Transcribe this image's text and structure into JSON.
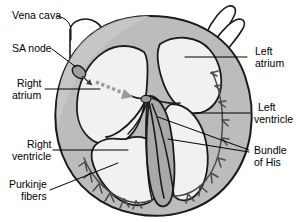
{
  "diagram": {
    "type": "anatomical-illustration",
    "labels": {
      "vena_cava": "Vena cava",
      "sa_node": "SA node",
      "right_atrium_line1": "Right",
      "right_atrium_line2": "atrium",
      "right_ventricle_line1": "Right",
      "right_ventricle_line2": "ventricle",
      "purkinje_line1": "Purkinje",
      "purkinje_line2": "fibers",
      "left_atrium_line1": "Left",
      "left_atrium_line2": "atrium",
      "left_ventricle_line1": "Left",
      "left_ventricle_line2": "ventricle",
      "bundle_of_his_line1": "Bundle",
      "bundle_of_his_line2": "of His"
    },
    "colors": {
      "outline": "#1a1a1a",
      "myocardium": "#b5b5b5",
      "myocardium_light": "#c8c8c8",
      "chamber": "#f0f0f0",
      "septum": "#a8a8a8",
      "vessel_fill": "#ffffff",
      "impulse_arrow": "#8c8c8c",
      "purkinje": "#4a4a4a",
      "leader_line": "#000000",
      "text": "#000000",
      "background": "#ffffff"
    }
  }
}
